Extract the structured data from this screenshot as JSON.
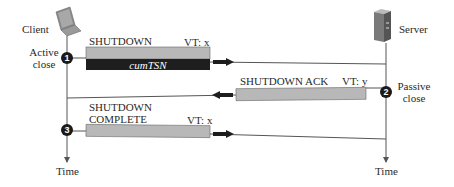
{
  "diagram": {
    "endpoints": {
      "client": {
        "label": "Client",
        "icon": "laptop-icon"
      },
      "server": {
        "label": "Server",
        "icon": "server-tower-icon"
      }
    },
    "states": {
      "active_close": {
        "line1": "Active",
        "line2": "close",
        "step": "1"
      },
      "passive_close": {
        "line1": "Passive",
        "line2": "close",
        "step": "2"
      },
      "complete_step": {
        "step": "3"
      }
    },
    "time_axes": {
      "client": "Time",
      "server": "Time"
    },
    "messages": [
      {
        "name": "SHUTDOWN",
        "vt": "VT: x",
        "field": "cumTSN",
        "direction": "client-to-server"
      },
      {
        "name": "SHUTDOWN ACK",
        "vt": "VT: y",
        "direction": "server-to-client"
      },
      {
        "name_line1": "SHUTDOWN",
        "name_line2": "COMPLETE",
        "vt": "VT: x",
        "direction": "client-to-server"
      }
    ],
    "colors": {
      "packet_fill": "#b8b8b8",
      "packet_dark": "#1e1e1e",
      "line": "#555555",
      "marker": "#1a1a1a"
    }
  }
}
